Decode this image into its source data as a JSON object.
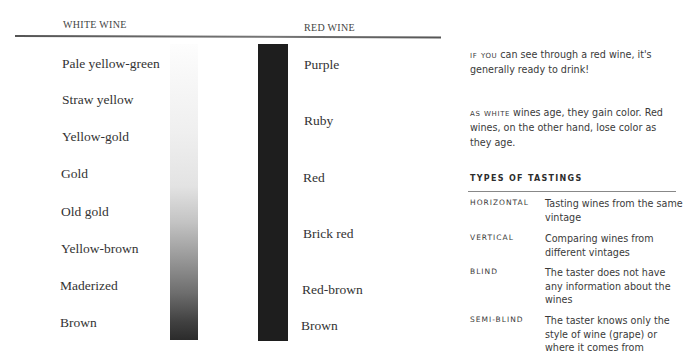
{
  "headers": {
    "white_wine": "WHITE WINE",
    "red_wine": "RED WINE"
  },
  "white_wine_colors": [
    {
      "label": "Pale yellow-green",
      "top": 56
    },
    {
      "label": "Straw yellow",
      "top": 92
    },
    {
      "label": "Yellow-gold",
      "top": 129
    },
    {
      "label": "Gold",
      "top": 166
    },
    {
      "label": "Old gold",
      "top": 204
    },
    {
      "label": "Yellow-brown",
      "top": 241
    },
    {
      "label": "Maderized",
      "top": 278
    },
    {
      "label": "Brown",
      "top": 315
    }
  ],
  "red_wine_colors": [
    {
      "label": "Purple",
      "top": 57
    },
    {
      "label": "Ruby",
      "top": 113
    },
    {
      "label": "Red",
      "top": 170
    },
    {
      "label": "Brick red",
      "top": 226
    },
    {
      "label": "Red-brown",
      "top": 282
    },
    {
      "label": "Brown",
      "top": 318
    }
  ],
  "bars": {
    "white_gradient_start": "#fdfdfd",
    "white_gradient_end": "#2b2b2b",
    "red_color": "#1e1e1e"
  },
  "notes": [
    {
      "lead": "If you",
      "text": " can see through a red wine, it's generally ready to drink!"
    },
    {
      "lead": "As white",
      "text": " wines age, they gain color. Red wines, on the other hand, lose color as they age."
    }
  ],
  "tastings": {
    "title": "TYPES OF TASTINGS",
    "rows": [
      {
        "term": "HORIZONTAL",
        "definition": "Tasting wines from the same vintage"
      },
      {
        "term": "VERTICAL",
        "definition": "Comparing wines from different vintages"
      },
      {
        "term": "BLIND",
        "definition": "The taster does not have any information about the wines"
      },
      {
        "term": "SEMI-BLIND",
        "definition": "The taster knows only the style of wine (grape) or where it comes from"
      }
    ]
  }
}
